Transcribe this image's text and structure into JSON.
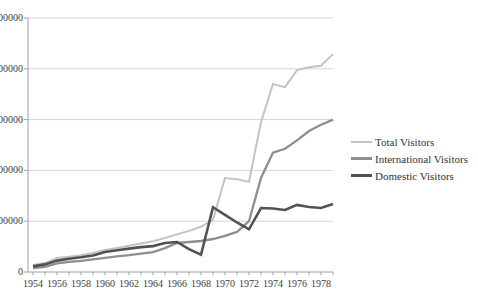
{
  "chart_data": {
    "type": "line",
    "title": "",
    "xlabel": "",
    "ylabel": "",
    "grid": true,
    "legend_position": "right",
    "ylim": [
      0,
      1000000
    ],
    "ytick_values": [
      0,
      200000,
      400000,
      600000,
      800000,
      1000000
    ],
    "ytick_labels": [
      "0",
      "200000",
      "400000",
      "600000",
      "800000",
      "1000000"
    ],
    "xtick_labels": [
      "1954",
      "1956",
      "1958",
      "1960",
      "1962",
      "1964",
      "1966",
      "1968",
      "1970",
      "1972",
      "1974",
      "1976",
      "1978"
    ],
    "x": [
      1954,
      1955,
      1956,
      1957,
      1958,
      1959,
      1960,
      1961,
      1962,
      1963,
      1964,
      1965,
      1966,
      1967,
      1968,
      1969,
      1970,
      1971,
      1972,
      1973,
      1974,
      1975,
      1976,
      1977,
      1978,
      1979
    ],
    "series": [
      {
        "name": "Total Visitors",
        "color": "#c3c3c3",
        "stroke_width": 2,
        "values": [
          28000,
          35000,
          55000,
          60000,
          66000,
          75000,
          87000,
          95000,
          103000,
          112000,
          121000,
          134000,
          148000,
          162000,
          178000,
          205000,
          370000,
          365000,
          355000,
          590000,
          740000,
          728000,
          795000,
          806000,
          812000,
          858000
        ]
      },
      {
        "name": "International Visitors",
        "color": "#8e8e8e",
        "stroke_width": 2.3,
        "values": [
          15000,
          20000,
          34000,
          40000,
          44000,
          50000,
          56000,
          62000,
          66000,
          72000,
          78000,
          94000,
          114000,
          118000,
          122000,
          130000,
          142000,
          158000,
          200000,
          370000,
          470000,
          485000,
          518000,
          555000,
          580000,
          600000
        ]
      },
      {
        "name": "Domestic Visitors",
        "color": "#525252",
        "stroke_width": 2.6,
        "values": [
          22000,
          30000,
          45000,
          52000,
          58000,
          65000,
          79000,
          86000,
          92000,
          98000,
          102000,
          114000,
          118000,
          90000,
          68000,
          255000,
          225000,
          195000,
          168000,
          252000,
          250000,
          244000,
          264000,
          256000,
          252000,
          268000
        ]
      }
    ]
  },
  "legend": {
    "items": [
      {
        "label": "Total Visitors",
        "color": "#c3c3c3",
        "line_height": 2
      },
      {
        "label": "International Visitors",
        "color": "#8e8e8e",
        "line_height": 3
      },
      {
        "label": "Domestic Visitors",
        "color": "#525252",
        "line_height": 3
      }
    ]
  },
  "style_colors": {
    "gridline": "#d6d6d6",
    "axis": "#a0a0a0",
    "tick": "#a0a0a0",
    "label_text": "#404040"
  }
}
